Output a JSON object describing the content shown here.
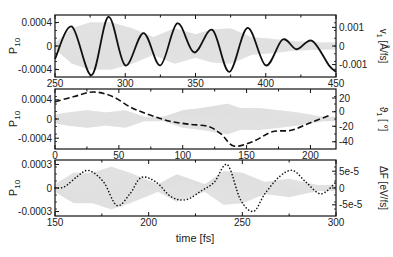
{
  "chart_data": [
    {
      "type": "line",
      "panel": 1,
      "xlim": [
        250,
        450
      ],
      "xticks": [
        250,
        300,
        350,
        400,
        450
      ],
      "ylabel_left": "P10",
      "ylim_left": [
        -0.0005,
        0.0005
      ],
      "yticks_left": [
        "0.0004",
        "0",
        "-0.0004"
      ],
      "ylabel_right": "v1 [Å/fs]",
      "yticks_right": [
        "0.001",
        "0",
        "-0.001"
      ],
      "series": [
        {
          "name": "P10 (gray fast oscillation)",
          "style": "gray fill",
          "envelope": [
            [
              250,
              5e-05
            ],
            [
              262,
              0.0003
            ],
            [
              275,
              0.0004
            ],
            [
              290,
              0.0004
            ],
            [
              305,
              0.0003
            ],
            [
              320,
              0.00015
            ],
            [
              335,
              0.0003
            ],
            [
              350,
              0.0002
            ],
            [
              362,
              0.00028
            ],
            [
              375,
              0.0003
            ],
            [
              390,
              0.00015
            ],
            [
              405,
              0.00012
            ],
            [
              420,
              8e-05
            ],
            [
              440,
              6e-05
            ]
          ]
        },
        {
          "name": "v1",
          "style": "solid black",
          "x": [
            250,
            262,
            276,
            288,
            300,
            313,
            325,
            337,
            349,
            362,
            374,
            387,
            400,
            412,
            422,
            433,
            445,
            450
          ],
          "y": [
            -0.0002,
            0.0003,
            -0.00045,
            0.00045,
            -0.0003,
            0.0002,
            -0.0003,
            0.00035,
            -0.0001,
            0.00025,
            -0.0004,
            0.00028,
            -0.0003,
            0.0001,
            -5e-05,
            8e-05,
            -0.0003,
            -0.0004
          ]
        }
      ]
    },
    {
      "type": "line",
      "panel": 2,
      "xlim": [
        0,
        220
      ],
      "xticks": [
        0,
        50,
        100,
        150,
        200
      ],
      "ylabel_left": "P10",
      "ylim_left": [
        -0.0007,
        0.0007
      ],
      "yticks_left": [
        "0.0004",
        "0",
        "-0.0004"
      ],
      "ylabel_right": "θ1 [°]",
      "ylim_right": [
        -45,
        35
      ],
      "yticks_right": [
        "20",
        "0",
        "-20",
        "-40"
      ],
      "series": [
        {
          "name": "P10 (gray fast oscillation)",
          "style": "gray fill",
          "envelope": [
            [
              0,
              0.0001
            ],
            [
              10,
              0.00015
            ],
            [
              25,
              0.0002
            ],
            [
              40,
              0.00015
            ],
            [
              55,
              0.0002
            ],
            [
              70,
              5e-05
            ],
            [
              85,
              5e-05
            ],
            [
              100,
              0.0002
            ],
            [
              115,
              0.00025
            ],
            [
              125,
              0.0003
            ],
            [
              135,
              0.00035
            ],
            [
              145,
              0.00025
            ],
            [
              160,
              0.00025
            ],
            [
              175,
              0.0002
            ],
            [
              190,
              0.00015
            ],
            [
              210,
              5e-05
            ]
          ]
        },
        {
          "name": "θ1",
          "style": "dashed black",
          "x": [
            0,
            15,
            30,
            45,
            60,
            75,
            90,
            105,
            120,
            130,
            140,
            155,
            170,
            185,
            200,
            215
          ],
          "y": [
            18,
            25,
            31,
            25,
            10,
            0,
            -8,
            -12,
            -15,
            -25,
            -41,
            -35,
            -22,
            -20,
            -10,
            0
          ]
        }
      ]
    },
    {
      "type": "line",
      "panel": 3,
      "xlim": [
        150,
        300
      ],
      "xticks": [
        150,
        200,
        250,
        300
      ],
      "xlabel": "time [fs]",
      "ylabel_left": "P10",
      "ylim_left": [
        -0.00035,
        0.00035
      ],
      "yticks_left": [
        "0.0003",
        "0",
        "-0.0003"
      ],
      "ylabel_right": "ΔF [eV/fs]",
      "yticks_right": [
        "5e-5",
        "0",
        "-5e-5"
      ],
      "series": [
        {
          "name": "P10 (gray fast oscillation)",
          "style": "gray fill",
          "envelope": [
            [
              150,
              5e-05
            ],
            [
              160,
              0.0002
            ],
            [
              170,
              0.0002
            ],
            [
              180,
              0.00028
            ],
            [
              190,
              0.0002
            ],
            [
              205,
              5e-05
            ],
            [
              215,
              0.00018
            ],
            [
              230,
              5e-05
            ],
            [
              240,
              0.00022
            ],
            [
              250,
              0.0002
            ],
            [
              262,
              8e-05
            ],
            [
              275,
              0.00012
            ],
            [
              290,
              4e-05
            ]
          ]
        },
        {
          "name": "ΔF",
          "style": "dotted black",
          "x": [
            150,
            155,
            162,
            168,
            176,
            183,
            190,
            196,
            204,
            212,
            220,
            228,
            235,
            242,
            249,
            256,
            262,
            270,
            277,
            284,
            292,
            300
          ],
          "y": [
            0,
            2e-05,
            0.0002,
            0.0003,
            0.0001,
            -0.0003,
            -0.0001,
            0.00018,
            0.0001,
            -0.00015,
            -0.0002,
            -5e-05,
            0.0001,
            0.0004,
            -0.0002,
            -0.0004,
            -0.0001,
            0.0002,
            0.0003,
            0.0001,
            -0.0001,
            0.0001
          ]
        }
      ]
    }
  ],
  "labels": {
    "p1_left": "P",
    "p1_left_sub": "10",
    "p1_right": "v",
    "p1_right_sub": "1",
    "p1_right_unit": " [Å/fs]",
    "p2_left": "P",
    "p2_left_sub": "10",
    "p2_right": "ϑ",
    "p2_right_sub": "1",
    "p2_right_unit": " [ °]",
    "p3_left": "P",
    "p3_left_sub": "10",
    "p3_right": "ΔF [eV/fs]",
    "xlabel": "time [fs]"
  }
}
